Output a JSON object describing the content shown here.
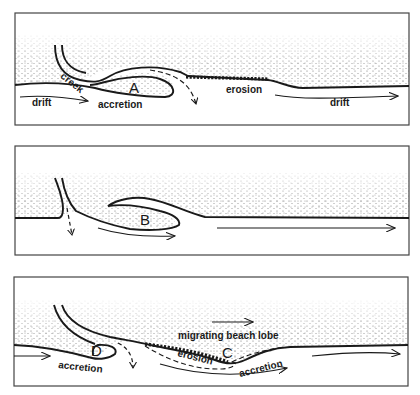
{
  "figure": {
    "type": "diagram",
    "panels": [
      {
        "id": "panel-1",
        "labels": {
          "creek": "creek",
          "point": "A",
          "drift_left": "drift",
          "accretion": "accretion",
          "erosion": "erosion",
          "drift_right": "drift"
        }
      },
      {
        "id": "panel-2",
        "labels": {
          "point": "B"
        }
      },
      {
        "id": "panel-3",
        "labels": {
          "migrating": "migrating beach lobe",
          "point_d": "D",
          "point_c": "C",
          "accretion_left": "accretion",
          "erosion": "erosion",
          "accretion_right": "accretion"
        }
      }
    ],
    "colors": {
      "line": "#1a1a1a",
      "stipple": "#7a7a7a",
      "frame": "#444444",
      "background": "#ffffff"
    }
  }
}
